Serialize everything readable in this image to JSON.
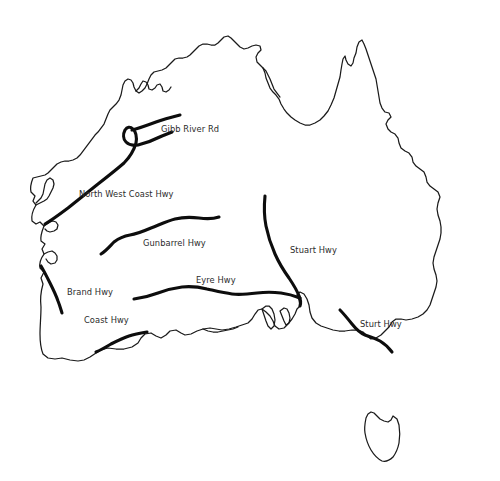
{
  "map": {
    "title": "Australia Highways Map",
    "background_color": "#ffffff",
    "outline_color": "#1a1a1a",
    "highway_color": "#0d0d0d",
    "label_color": "#2b2b2b",
    "regions": [
      {
        "name": "australia-mainland"
      },
      {
        "name": "tasmania"
      }
    ],
    "labels": [
      {
        "id": "gibb-river-rd",
        "text": "Gibb River Rd",
        "x": 161,
        "y": 125
      },
      {
        "id": "north-west-coast-hwy",
        "text": "North West Coast Hwy",
        "x": 79,
        "y": 190
      },
      {
        "id": "gunbarrel-hwy",
        "text": "Gunbarrel Hwy",
        "x": 143,
        "y": 239
      },
      {
        "id": "stuart-hwy",
        "text": "Stuart Hwy",
        "x": 290,
        "y": 246
      },
      {
        "id": "eyre-hwy",
        "text": "Eyre Hwy",
        "x": 196,
        "y": 276
      },
      {
        "id": "brand-hwy",
        "text": "Brand Hwy",
        "x": 67,
        "y": 288
      },
      {
        "id": "coast-hwy",
        "text": "Coast Hwy",
        "x": 84,
        "y": 316
      },
      {
        "id": "sturt-hwy",
        "text": "Sturt Hwy",
        "x": 360,
        "y": 320
      }
    ],
    "highways": [
      {
        "id": "gibb-river-rd",
        "label": "Gibb River Rd"
      },
      {
        "id": "north-west-coast-hwy",
        "label": "North West Coast Hwy"
      },
      {
        "id": "gunbarrel-hwy",
        "label": "Gunbarrel Hwy"
      },
      {
        "id": "stuart-hwy",
        "label": "Stuart Hwy"
      },
      {
        "id": "eyre-hwy",
        "label": "Eyre Hwy"
      },
      {
        "id": "brand-hwy",
        "label": "Brand Hwy"
      },
      {
        "id": "coast-hwy",
        "label": "Coast Hwy"
      },
      {
        "id": "sturt-hwy",
        "label": "Sturt Hwy"
      }
    ]
  }
}
